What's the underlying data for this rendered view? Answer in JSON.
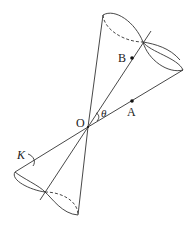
{
  "diagram": {
    "type": "double-cone",
    "labels": {
      "vertex": "O",
      "pointA": "A",
      "pointB": "B",
      "angle": "θ",
      "curve": "K"
    },
    "colors": {
      "stroke": "#333333",
      "background": "#ffffff"
    }
  }
}
